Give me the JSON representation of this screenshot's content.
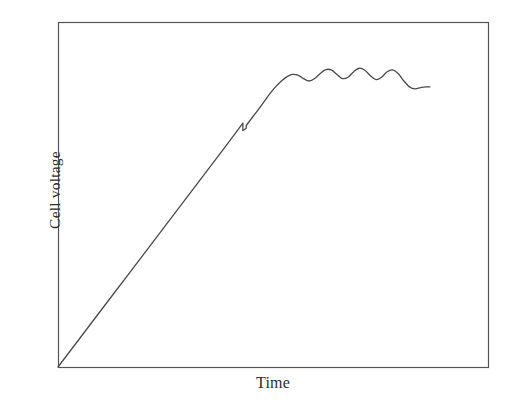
{
  "figure": {
    "name": "cell-voltage-vs-time-schematic",
    "background_color": "#ffffff",
    "width": 506,
    "height": 411
  },
  "axes": {
    "y_label": "Cell voltage",
    "x_label": "Time",
    "frame_color": "#555555",
    "frame": {
      "left": 58,
      "top": 22,
      "right": 488,
      "bottom": 367
    },
    "tick_labels_shown": false
  },
  "curve": {
    "name": "cell-voltage-trace",
    "color": "#4a4a4a",
    "line_width": 1.3,
    "style": "solid"
  },
  "chart_data": {
    "type": "line",
    "title": "",
    "subtitle": "",
    "xlabel": "Time",
    "ylabel": "Cell voltage",
    "grid": false,
    "legend": "none",
    "axis_ticks": "none",
    "xlim": [
      0,
      1
    ],
    "ylim": [
      0,
      1
    ],
    "annotations": [
      "linear ramp from origin",
      "small sawtooth notch near end of ramp",
      "damped oscillation plateau"
    ],
    "series": [
      {
        "name": "Cell voltage",
        "color": "#4a4a4a",
        "x": [
          0.0,
          0.05,
          0.1,
          0.15,
          0.2,
          0.25,
          0.3,
          0.35,
          0.4,
          0.45,
          0.48,
          0.497,
          0.497,
          0.506,
          0.506,
          0.52,
          0.54,
          0.56,
          0.58,
          0.6,
          0.615,
          0.63,
          0.645,
          0.66,
          0.675,
          0.69,
          0.705,
          0.72,
          0.735,
          0.75,
          0.765,
          0.78,
          0.795,
          0.81,
          0.825,
          0.84,
          0.855,
          0.87,
          0.885,
          0.9,
          0.915,
          0.93,
          0.945,
          0.96,
          0.975,
          0.99,
          1.0
        ],
        "y": [
          0.0,
          0.071,
          0.142,
          0.213,
          0.284,
          0.355,
          0.426,
          0.497,
          0.568,
          0.639,
          0.682,
          0.707,
          0.685,
          0.692,
          0.7,
          0.72,
          0.748,
          0.778,
          0.806,
          0.828,
          0.841,
          0.848,
          0.846,
          0.836,
          0.829,
          0.836,
          0.851,
          0.862,
          0.861,
          0.848,
          0.836,
          0.84,
          0.856,
          0.866,
          0.86,
          0.844,
          0.833,
          0.84,
          0.856,
          0.861,
          0.85,
          0.829,
          0.812,
          0.806,
          0.81,
          0.812,
          0.812
        ]
      }
    ]
  }
}
